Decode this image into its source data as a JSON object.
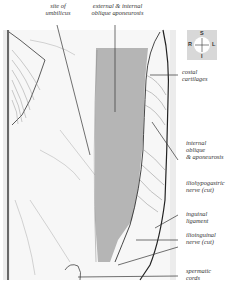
{
  "figure": {
    "colors": {
      "aponeurosis_fill": "#b5b5b5",
      "background_panel": "#e6e6e6",
      "line": "#333333",
      "faint_line": "#9a9a9a"
    },
    "compass": {
      "top": "S",
      "bottom": "I",
      "left": "R",
      "right": "L"
    },
    "labels": {
      "umbilicus": "site of\numbilicus",
      "oblique_aponeurosis": "external & internal\noblique aponeurosis",
      "costal_cartilages": "costal\ncartilages",
      "internal_oblique": "internal\noblique\n& aponeurosis",
      "iliohypogastric": "iliohypogastric\nnerve (cut)",
      "inguinal_ligament": "inguinal\nligament",
      "ilioinguinal": "ilioinguinal\nnerve (cut)",
      "spermatic_cords": "spermatic\ncords"
    }
  }
}
